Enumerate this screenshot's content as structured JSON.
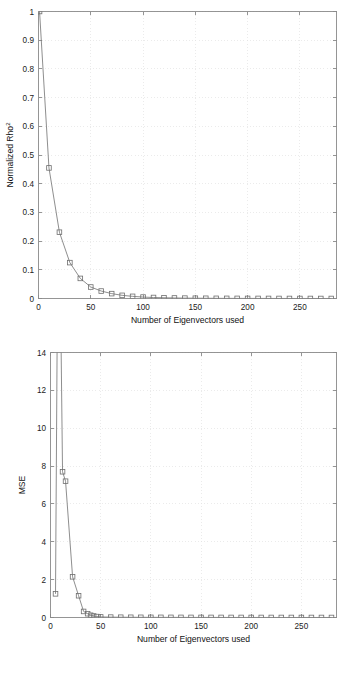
{
  "figure": {
    "background": "#ffffff",
    "line_color": "#7a7a7a",
    "marker_color": "#6e6e6e",
    "grid_color": "#e2e2e2",
    "axis_color": "#8a8a8a",
    "text_color": "#1a1a1a"
  },
  "chart_data": [
    {
      "id": "normalized-rho-squared-chart",
      "type": "line",
      "title": "",
      "xlabel": "Number of Eigenvectors used",
      "ylabel": "Normalized Rho²",
      "ylabel_base": "Normalized Rho",
      "ylabel_exponent": "2",
      "xlim": [
        0,
        285
      ],
      "ylim": [
        0,
        1
      ],
      "xticks": [
        0,
        50,
        100,
        150,
        200,
        250
      ],
      "xticklabels": [
        "0",
        "50",
        "100",
        "150",
        "200",
        "250"
      ],
      "yticks": [
        0,
        0.1,
        0.2,
        0.3,
        0.4,
        0.5,
        0.6,
        0.7,
        0.8,
        0.9,
        1
      ],
      "yticklabels": [
        "0",
        "0.1",
        "0.2",
        "0.3",
        "0.4",
        "0.5",
        "0.6",
        "0.7",
        "0.8",
        "0.9",
        "1"
      ],
      "grid": true,
      "grid_style": "dotted",
      "legend": "none",
      "marker": "square",
      "series": [
        {
          "name": "Normalized Rho^2",
          "x": [
            1,
            10,
            20,
            30,
            40,
            50,
            60,
            70,
            80,
            90,
            100,
            110,
            120,
            130,
            140,
            150,
            160,
            170,
            180,
            190,
            200,
            210,
            220,
            230,
            240,
            250,
            260,
            270,
            280
          ],
          "values": [
            1.0,
            0.455,
            0.231,
            0.125,
            0.07,
            0.04,
            0.026,
            0.017,
            0.011,
            0.0075,
            0.005,
            0.0035,
            0.0025,
            0.0018,
            0.0013,
            0.001,
            0.0008,
            0.0006,
            0.0005,
            0.0004,
            0.0003,
            0.00025,
            0.0002,
            0.00015,
            0.0001,
            8e-05,
            6e-05,
            4e-05,
            2e-05
          ]
        }
      ]
    },
    {
      "id": "mse-chart",
      "type": "line",
      "title": "",
      "xlabel": "Number of Eigenvectors used",
      "ylabel": "MSE",
      "xlim": [
        0,
        285
      ],
      "ylim": [
        0,
        14
      ],
      "xticks": [
        0,
        50,
        100,
        150,
        200,
        250
      ],
      "xticklabels": [
        "0",
        "50",
        "100",
        "150",
        "200",
        "250"
      ],
      "yticks": [
        0,
        2,
        4,
        6,
        8,
        10,
        12,
        14
      ],
      "yticklabels": [
        "0",
        "2",
        "4",
        "6",
        "8",
        "10",
        "12",
        "14"
      ],
      "grid": true,
      "grid_style": "dotted",
      "legend": "none",
      "marker": "square",
      "note": "Second data point spikes above the visible y-axis limit of 14 and is clipped by the axes box.",
      "series": [
        {
          "name": "MSE",
          "x": [
            5,
            8,
            12,
            15,
            22,
            28,
            33,
            37,
            40,
            43,
            46,
            50,
            60,
            70,
            80,
            90,
            100,
            110,
            120,
            130,
            140,
            150,
            160,
            170,
            180,
            190,
            200,
            210,
            220,
            230,
            240,
            250,
            260,
            270,
            280
          ],
          "values": [
            1.25,
            26.0,
            7.7,
            7.2,
            2.15,
            1.15,
            0.32,
            0.2,
            0.12,
            0.08,
            0.05,
            0.03,
            0.02,
            0.015,
            0.012,
            0.01,
            0.009,
            0.008,
            0.007,
            0.006,
            0.005,
            0.0045,
            0.004,
            0.0035,
            0.003,
            0.0028,
            0.0025,
            0.0022,
            0.002,
            0.0018,
            0.0015,
            0.0012,
            0.001,
            0.0008,
            0.0005
          ]
        }
      ]
    }
  ]
}
